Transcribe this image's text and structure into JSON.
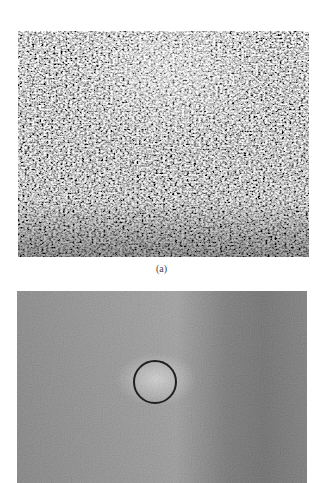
{
  "figure": {
    "panels": [
      {
        "id": "a",
        "label": "(a)",
        "description": "high-contrast speckle noise image",
        "tones": {
          "dark": "#2a2a2a",
          "mid": "#8a8a8a",
          "light": "#f2f2f2"
        }
      },
      {
        "id": "b",
        "label": "",
        "description": "smoothed grey image with circled bright spot",
        "tones": {
          "base": "#8c8c8c",
          "light": "#b8b8b8",
          "dark": "#5e5e5e"
        },
        "marker": {
          "shape": "circle",
          "cx": 155,
          "cy": 382,
          "r": 22,
          "color": "#1f1f1f"
        }
      }
    ]
  }
}
